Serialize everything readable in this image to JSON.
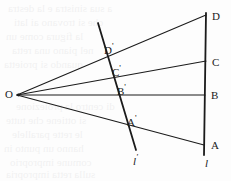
{
  "figure": {
    "type": "geometry-diagram",
    "background_color": "#fdfdfd",
    "ink_color": "#1b1b1b",
    "canvas": {
      "width": 231,
      "height": 181
    },
    "vertex": {
      "label": "O",
      "x": 17,
      "y": 95
    },
    "lines": [
      {
        "name": "line-l",
        "label": "l",
        "label_x": 205,
        "label_y": 158,
        "orientation": "vertical",
        "x1": 206,
        "y1": 13,
        "x2": 204,
        "y2": 155,
        "stroke_width": 1.8
      },
      {
        "name": "line-l-prime",
        "label": "l",
        "prime": "'",
        "label_x": 133,
        "label_y": 152,
        "orientation": "oblique",
        "x1": 98,
        "y1": 23,
        "x2": 136,
        "y2": 150,
        "stroke_width": 1.8
      }
    ],
    "rays": [
      {
        "name": "ray-OD",
        "from": "O",
        "to": "D",
        "x1": 17,
        "y1": 95,
        "x2": 206,
        "y2": 15
      },
      {
        "name": "ray-OC",
        "from": "O",
        "to": "C",
        "x1": 17,
        "y1": 95,
        "x2": 206,
        "y2": 61
      },
      {
        "name": "ray-OB",
        "from": "O",
        "to": "B",
        "x1": 17,
        "y1": 95,
        "x2": 205,
        "y2": 95
      },
      {
        "name": "ray-OA",
        "from": "O",
        "to": "A",
        "x1": 17,
        "y1": 95,
        "x2": 204,
        "y2": 145
      }
    ],
    "points_on_l": [
      {
        "label": "D",
        "x": 206,
        "y": 15,
        "label_x": 212,
        "label_y": 11
      },
      {
        "label": "C",
        "x": 206,
        "y": 61,
        "label_x": 212,
        "label_y": 57
      },
      {
        "label": "B",
        "x": 205,
        "y": 95,
        "label_x": 211,
        "label_y": 90
      },
      {
        "label": "A",
        "x": 204,
        "y": 145,
        "label_x": 211,
        "label_y": 140
      }
    ],
    "points_on_l_prime": [
      {
        "label": "D",
        "prime": "'",
        "x": 105,
        "y": 52,
        "label_x": 104,
        "label_y": 41
      },
      {
        "label": "C",
        "prime": "'",
        "x": 113,
        "y": 75,
        "label_x": 112,
        "label_y": 63
      },
      {
        "label": "B",
        "prime": "'",
        "x": 118,
        "y": 95,
        "label_x": 117,
        "label_y": 82
      },
      {
        "label": "A",
        "prime": "'",
        "x": 127,
        "y": 122,
        "label_x": 127,
        "label_y": 113
      }
    ],
    "bleed_text": [
      {
        "text": "a sua sinistra e la destra",
        "x": 8,
        "y": 2
      },
      {
        "text": "che si trovano ai lati",
        "x": 14,
        "y": 16
      },
      {
        "text": "la figura come un",
        "x": 6,
        "y": 30
      },
      {
        "text": "nel piano una retta",
        "x": 12,
        "y": 44
      },
      {
        "text": "quando si proietta",
        "x": 4,
        "y": 58
      },
      {
        "text": "di centro la proiezione",
        "x": 16,
        "y": 100
      },
      {
        "text": "si ottiene che tutte",
        "x": 6,
        "y": 114
      },
      {
        "text": "le rette parallele",
        "x": 12,
        "y": 128
      },
      {
        "text": "hanno un punto in",
        "x": 4,
        "y": 142
      },
      {
        "text": "comune improprio",
        "x": 10,
        "y": 156
      },
      {
        "text": "sulla retta impropria",
        "x": 6,
        "y": 168
      }
    ]
  }
}
